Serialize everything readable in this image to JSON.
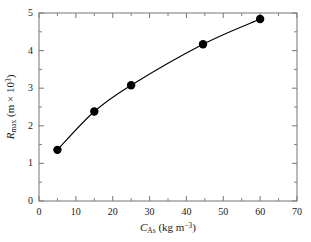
{
  "chart_data": {
    "type": "line",
    "title": "",
    "subtitle": "",
    "xlabel_plain": "C_As (kg m^-3)",
    "ylabel_plain": "R_max (m x 10^3)",
    "xlabel_parts": {
      "symbol": "C",
      "subscript": "As",
      "units": " (kg m",
      "unit_exponent": "−3",
      "units_close": ")"
    },
    "ylabel_parts": {
      "symbol": "R",
      "subscript": "max",
      "units": " (m × 10",
      "unit_exponent": "3",
      "units_close": ")"
    },
    "xlim": [
      0,
      70
    ],
    "ylim": [
      0,
      5
    ],
    "xticks": [
      0,
      10,
      20,
      30,
      40,
      50,
      60,
      70
    ],
    "yticks": [
      0,
      1,
      2,
      3,
      4,
      5
    ],
    "xtick_labels": [
      "0",
      "10",
      "20",
      "30",
      "40",
      "50",
      "60",
      "70"
    ],
    "ytick_labels": [
      "0",
      "1",
      "2",
      "3",
      "4",
      "5"
    ],
    "x_minor_tick_interval": 5,
    "y_minor_tick_interval": 0.5,
    "grid": false,
    "legend": null,
    "frame": "box",
    "series": [
      {
        "name": "R_max vs C_As",
        "marker": "filled-circle",
        "marker_color": "#000000",
        "line_color": "#000000",
        "x": [
          5,
          15,
          25,
          44.5,
          60
        ],
        "y": [
          1.36,
          2.38,
          3.08,
          4.17,
          4.84
        ]
      }
    ]
  },
  "figure": {
    "background_color": "#ffffff",
    "axis_color": "#808080",
    "data_color": "#000000",
    "marker_radius_px": 4.2
  }
}
